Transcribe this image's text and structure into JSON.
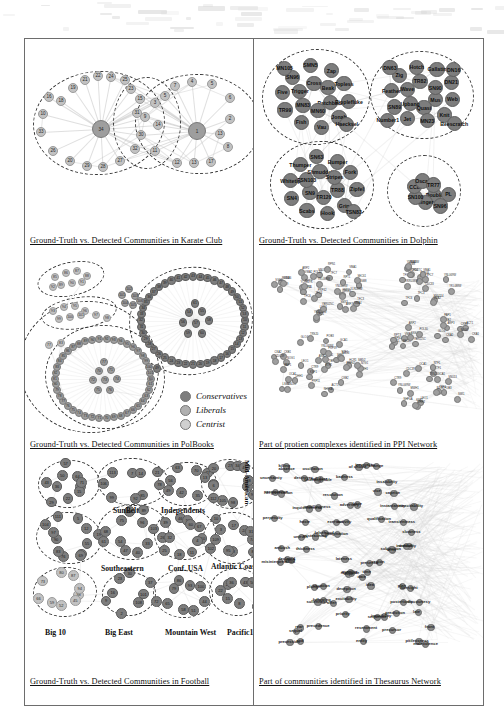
{
  "figure": {
    "panels": [
      {
        "id": "karate",
        "caption": "Ground-Truth vs. Detected Communities in Karate Club",
        "network": "Karate Club",
        "node_labels": [
          "34",
          "33",
          "1",
          "2",
          "3",
          "4",
          "5",
          "6",
          "7",
          "8",
          "9",
          "10",
          "11",
          "12",
          "13",
          "14",
          "15",
          "16",
          "17",
          "18",
          "19",
          "20",
          "21",
          "22",
          "23",
          "24",
          "25",
          "26",
          "27",
          "28",
          "29",
          "30",
          "31",
          "32"
        ],
        "community_count": 3
      },
      {
        "id": "dolphin",
        "caption": "Ground-Truth vs. Detected Communities in Dolphin",
        "network": "Dolphin",
        "community_count": 4,
        "communities": [
          {
            "name": "top-left",
            "members": [
              "Patchback",
              "MN60",
              "MN83",
              "Trigger",
              "Cross",
              "Beak",
              "Ripplefluke",
              "Jonah",
              "Vau",
              "Fish",
              "TR99",
              "Five",
              "SN96",
              "SMN5",
              "Zap",
              "Topless",
              "Haecksel",
              "MN105"
            ]
          },
          {
            "name": "top-right",
            "members": [
              "Mus",
              "Quasi",
              "Upbang",
              "Wave",
              "TR82",
              "SN90",
              "Web",
              "Knit",
              "MN23",
              "Jet",
              "SN89",
              "Feather",
              "Zig",
              "Hotch",
              "Gallatin",
              "DN21",
              "Beescratch",
              "Number1",
              "DN63",
              "DN16"
            ]
          },
          {
            "name": "bottom-left",
            "members": [
              "TR88",
              "TR120",
              "SN9",
              "TSN103",
              "Shmuddel",
              "Stripes",
              "Zipfel",
              "Grin",
              "Hook",
              "Scabs",
              "SN4",
              "Whitetip",
              "Thumper",
              "SN63",
              "Bumper",
              "Fork",
              "TSN83"
            ]
          },
          {
            "name": "bottom-right",
            "members": [
              "Double",
              "Ringer",
              "SN100",
              "CCL",
              "Oscar",
              "TR77",
              "PL",
              "SN96"
            ]
          }
        ]
      },
      {
        "id": "polbooks",
        "caption": "Ground-Truth vs. Detected Communities in PolBooks",
        "network": "PolBooks",
        "legend": [
          {
            "label": "Conservatives",
            "color": "#7d7d7d"
          },
          {
            "label": "Liberals",
            "color": "#b0b0b0"
          },
          {
            "label": "Centrist",
            "color": "#d0d0d0"
          }
        ]
      },
      {
        "id": "ppi",
        "caption": "Part of protien complexes identified in PPI Network",
        "network": "PPI Network",
        "sample_labels": [
          "PRP42",
          "PRP39",
          "PRP11",
          "SMD2",
          "SMX3",
          "LSM4",
          "LSM8",
          "YCR84TC",
          "PRP46",
          "SNU114",
          "MUD2",
          "TFC1",
          "TFC3",
          "TFC4",
          "TFC6",
          "TFC7",
          "YLR033W",
          "YKL088W",
          "YNL069W",
          "CDC33",
          "YKR038W",
          "VMA1",
          "VMA2",
          "VMA4",
          "VMA6",
          "RPN1",
          "RPT1",
          "RPT3",
          "SEC61",
          "SSS1",
          "YBR025C",
          "POL30",
          "ARP2",
          "ARP3",
          "ACT1",
          "CKA1",
          "CKA2",
          "CKB1",
          "CKB2",
          "NOG1",
          "GLO4",
          "PAP1",
          "POB3",
          "TBF1",
          "NHP6A",
          "MWH1",
          "NTG1",
          "YNL069W",
          "SWI1",
          "LEO1",
          "CTR9",
          "RTF1",
          "SNU13",
          "GCA1",
          "NTF1",
          "DHH1",
          "OCA1",
          "KSP1",
          "TRS20",
          "CDC39",
          "ANB1",
          "HCR1"
        ]
      },
      {
        "id": "football",
        "caption": "Ground-Truth vs. Detected Communities in Football",
        "network": "Football",
        "conference_labels": [
          "SunBelt",
          "Independents",
          "Mid-American",
          "Southeastern",
          "Conf. USA",
          "Atlantic Coast"
        ],
        "bottom_labels": [
          "Big 10",
          "Big East",
          "Mountain West",
          "Pacific10"
        ]
      },
      {
        "id": "thesaurus",
        "caption": "Part of communities identified in Thesaurus Network",
        "network": "Thesaurus Network",
        "words": [
          "oscillation",
          "change",
          "inequality",
          "absence",
          "of choice",
          "killing",
          "destroyer",
          "unchangeable",
          "uncertainty",
          "evil doer",
          "badness",
          "insalubrity",
          "resolution",
          "permanence",
          "vice",
          "tergiversation",
          "caprice",
          "adversary",
          "bane",
          "inexcitability",
          "inquisitiveness",
          "instantaneity",
          "unwillingness",
          "qualification",
          "activity",
          "exertion",
          "transientness",
          "haste",
          "perpetuity",
          "imagination",
          "slowness",
          "falsehood",
          "untruth",
          "misteaching",
          "term",
          "ambush",
          "subjection",
          "thickness",
          "credulity",
          "intuition",
          "lateness",
          "misinterpretation",
          "declared",
          "region",
          "place",
          "presence",
          "date",
          "quantity",
          "time",
          "multitude",
          "dupe",
          "idea",
          "plan",
          "foresight",
          "plunge",
          "situation",
          "deception",
          "excitability",
          "offer",
          "posteriority",
          "sullenness",
          "discourtesy",
          "following",
          "priority",
          "sequence",
          "late",
          "irascibility",
          "prediction",
          "precedence",
          "resentment",
          "front",
          "sequel",
          "rear",
          "precursor",
          "malevolence",
          "entity",
          "end",
          "precession",
          "pitilessness"
        ]
      }
    ]
  }
}
